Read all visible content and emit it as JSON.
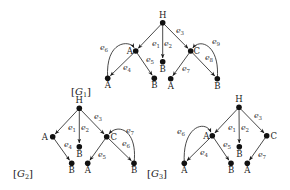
{
  "graphs": [
    {
      "id": "G1",
      "label_prefix": "[",
      "label_main": "G",
      "label_sub": "1",
      "label_suffix": "]",
      "label_pos": [
        71,
        95
      ],
      "nodes": [
        {
          "id": "H",
          "label": "H",
          "x": 162.7,
          "y": 22.7,
          "label_dx": 0,
          "label_dy": -5
        },
        {
          "id": "A1",
          "label": "A",
          "x": 135.7,
          "y": 51,
          "label_dx": -6,
          "label_dy": 3
        },
        {
          "id": "Bm",
          "label": "B",
          "x": 162.7,
          "y": 61.7,
          "label_dx": 0,
          "label_dy": 10
        },
        {
          "id": "C",
          "label": "C",
          "x": 190.7,
          "y": 51,
          "label_dx": 6,
          "label_dy": 3
        },
        {
          "id": "A2",
          "label": "A",
          "x": 107.7,
          "y": 78.3,
          "label_dx": 0,
          "label_dy": 10
        },
        {
          "id": "B2",
          "label": "B",
          "x": 154.3,
          "y": 78.3,
          "label_dx": 0,
          "label_dy": 10
        },
        {
          "id": "A3",
          "label": "A",
          "x": 170.7,
          "y": 78.7,
          "label_dx": 0,
          "label_dy": 10
        },
        {
          "id": "B3",
          "label": "B",
          "x": 217.3,
          "y": 78.7,
          "label_dx": 0,
          "label_dy": 10
        }
      ],
      "edges": [
        {
          "from": "H",
          "to": "A1",
          "label": "e",
          "sub": "1",
          "lx": 156,
          "ly": 46
        },
        {
          "from": "H",
          "to": "Bm",
          "label": "e",
          "sub": "2",
          "lx": 168,
          "ly": 46
        },
        {
          "from": "H",
          "to": "C",
          "label": "e",
          "sub": "3",
          "lx": 180,
          "ly": 33
        },
        {
          "from": "A1",
          "to": "A2",
          "label": "e",
          "sub": "4",
          "lx": 127,
          "ly": 70
        },
        {
          "from": "A1",
          "to": "B2",
          "label": "e",
          "sub": "5",
          "lx": 150,
          "ly": 62
        },
        {
          "from": "A2",
          "to": "A1",
          "label": "e",
          "sub": "6",
          "lx": 104,
          "ly": 50,
          "curve": [
            105,
            40,
            130,
            40
          ]
        },
        {
          "from": "C",
          "to": "A3",
          "label": "e",
          "sub": "7",
          "lx": 186,
          "ly": 71
        },
        {
          "from": "C",
          "to": "B3",
          "label": "e",
          "sub": "8",
          "lx": 209,
          "ly": 60
        },
        {
          "from": "B3",
          "to": "C",
          "label": "e",
          "sub": "9",
          "lx": 216,
          "ly": 44,
          "curve": [
            220,
            45,
            200,
            38
          ]
        }
      ]
    },
    {
      "id": "G2",
      "label_prefix": "[",
      "label_main": "G",
      "label_sub": "2",
      "label_suffix": "]",
      "label_pos": [
        13,
        177
      ],
      "nodes": [
        {
          "id": "H",
          "label": "H",
          "x": 79.3,
          "y": 108.3,
          "label_dx": 0,
          "label_dy": -5
        },
        {
          "id": "A1",
          "label": "A",
          "x": 52.7,
          "y": 136.7,
          "label_dx": -8,
          "label_dy": 3
        },
        {
          "id": "Bm",
          "label": "B",
          "x": 79.3,
          "y": 146.7,
          "label_dx": 0,
          "label_dy": 10
        },
        {
          "id": "C",
          "label": "C",
          "x": 106.7,
          "y": 136.7,
          "label_dx": 7,
          "label_dy": 3
        },
        {
          "id": "B2",
          "label": "B",
          "x": 71.7,
          "y": 163.3,
          "label_dx": 0,
          "label_dy": 10
        },
        {
          "id": "A3",
          "label": "A",
          "x": 87.7,
          "y": 163.3,
          "label_dx": 0,
          "label_dy": 10
        },
        {
          "id": "B3",
          "label": "B",
          "x": 134,
          "y": 163.3,
          "label_dx": 0,
          "label_dy": 10
        }
      ],
      "edges": [
        {
          "from": "H",
          "to": "A1",
          "label": "e",
          "sub": "1",
          "lx": 72,
          "ly": 130
        },
        {
          "from": "H",
          "to": "Bm",
          "label": "e",
          "sub": "2",
          "lx": 85,
          "ly": 130
        },
        {
          "from": "H",
          "to": "C",
          "label": "e",
          "sub": "3",
          "lx": 98,
          "ly": 119
        },
        {
          "from": "A1",
          "to": "B2",
          "label": "e",
          "sub": "4",
          "lx": 68,
          "ly": 147
        },
        {
          "from": "C",
          "to": "A3",
          "label": "e",
          "sub": "5",
          "lx": 102,
          "ly": 157
        },
        {
          "from": "C",
          "to": "B3",
          "label": "e",
          "sub": "6",
          "lx": 126,
          "ly": 146
        },
        {
          "from": "B3",
          "to": "C",
          "label": "e",
          "sub": "7",
          "lx": 130,
          "ly": 133,
          "curve": [
            138,
            130,
            118,
            123
          ]
        }
      ]
    },
    {
      "id": "G3",
      "label_prefix": "[",
      "label_main": "G",
      "label_sub": "3",
      "label_suffix": "]",
      "label_pos": [
        147,
        177
      ],
      "nodes": [
        {
          "id": "H",
          "label": "H",
          "x": 239,
          "y": 107.3,
          "label_dx": 0,
          "label_dy": -5
        },
        {
          "id": "A1",
          "label": "A",
          "x": 212.3,
          "y": 135.7,
          "label_dx": -6,
          "label_dy": 3
        },
        {
          "id": "Bm",
          "label": "B",
          "x": 239.3,
          "y": 146.7,
          "label_dx": 0,
          "label_dy": 10
        },
        {
          "id": "C",
          "label": "C",
          "x": 266.7,
          "y": 135.7,
          "label_dx": 7,
          "label_dy": 3
        },
        {
          "id": "A2",
          "label": "A",
          "x": 184.3,
          "y": 163.3,
          "label_dx": 0,
          "label_dy": 10
        },
        {
          "id": "B2",
          "label": "B",
          "x": 231,
          "y": 163.3,
          "label_dx": 0,
          "label_dy": 10
        },
        {
          "id": "A3",
          "label": "A",
          "x": 247.3,
          "y": 163.3,
          "label_dx": 0,
          "label_dy": 10
        }
      ],
      "edges": [
        {
          "from": "H",
          "to": "A1",
          "label": "e",
          "sub": "1",
          "lx": 232,
          "ly": 130
        },
        {
          "from": "H",
          "to": "Bm",
          "label": "e",
          "sub": "2",
          "lx": 245,
          "ly": 130
        },
        {
          "from": "H",
          "to": "C",
          "label": "e",
          "sub": "3",
          "lx": 258,
          "ly": 118
        },
        {
          "from": "A1",
          "to": "A2",
          "label": "e",
          "sub": "4",
          "lx": 204,
          "ly": 155
        },
        {
          "from": "A1",
          "to": "B2",
          "label": "e",
          "sub": "5",
          "lx": 227,
          "ly": 147
        },
        {
          "from": "A2",
          "to": "A1",
          "label": "e",
          "sub": "6",
          "lx": 181,
          "ly": 134,
          "curve": [
            182,
            125,
            206,
            120
          ]
        },
        {
          "from": "C",
          "to": "A3",
          "label": "e",
          "sub": "7",
          "lx": 262,
          "ly": 157
        }
      ]
    }
  ]
}
